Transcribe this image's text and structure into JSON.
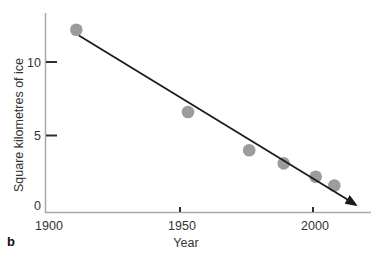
{
  "figure": {
    "panel_label": "b",
    "xlabel": "Year",
    "ylabel": "Square kilometres of ice"
  },
  "chart_data": {
    "type": "scatter",
    "title": "",
    "xlabel": "Year",
    "ylabel": "Square kilometres of ice",
    "xlim": [
      1899,
      2022
    ],
    "ylim": [
      0,
      13.6
    ],
    "grid": false,
    "legend": null,
    "x_ticks": [
      {
        "value": 1900,
        "label": "1900",
        "mark": false
      },
      {
        "value": 1950,
        "label": "1950",
        "mark": true
      },
      {
        "value": 2000,
        "label": "2000",
        "mark": true
      }
    ],
    "y_ticks": [
      {
        "value": 0,
        "label": "0",
        "mark": false
      },
      {
        "value": 5,
        "label": "5",
        "mark": true
      },
      {
        "value": 10,
        "label": "10",
        "mark": true
      }
    ],
    "points": [
      {
        "year": 1911,
        "ice": 12.2
      },
      {
        "year": 1953,
        "ice": 6.6
      },
      {
        "year": 1976,
        "ice": 4.0
      },
      {
        "year": 1989,
        "ice": 3.1
      },
      {
        "year": 2001,
        "ice": 2.2
      },
      {
        "year": 2008,
        "ice": 1.6
      }
    ],
    "trend_line": {
      "start": {
        "year": 1912,
        "ice": 11.8
      },
      "end": {
        "year": 2016,
        "ice": 0.3
      },
      "arrow_end": true
    },
    "colors": {
      "point": "#9c9c9c",
      "trend": "#1c1c1c",
      "axis": "#a9a9a9",
      "tick_mark": "#2e2e2e",
      "text": "#333333",
      "background": "#ffffff"
    }
  }
}
